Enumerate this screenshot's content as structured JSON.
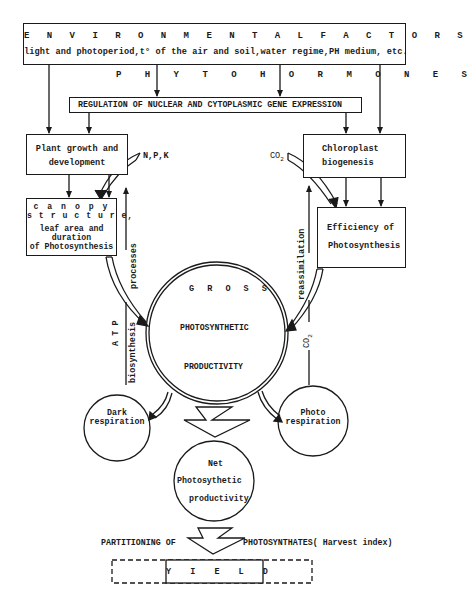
{
  "environmental_factors": {
    "title": "E N V I R O N M E N T A L   F A C T O R S",
    "subtitle": "light and photoperiod,t° of the air and soil,water regime,PH medium, etc."
  },
  "phytohormones": {
    "label": "P H Y T O H O R M O N E S"
  },
  "regulation": {
    "label": "REGULATION OF NUCLEAR AND CYTOPLASMIC GENE EXPRESSION"
  },
  "plant_growth": {
    "line1": "Plant growth  and",
    "line2": "development"
  },
  "npk": {
    "label": "N,P,K"
  },
  "chloroplast": {
    "line1": "Chloroplast",
    "line2": "biogenesis"
  },
  "co2_top": {
    "label": "CO",
    "sub": "2"
  },
  "canopy": {
    "line1": "c a n o p y",
    "line2": "s t r u c t u r e,",
    "line3": "leaf area  and",
    "line4": "duration",
    "line5": "of Photosynthesis"
  },
  "efficiency": {
    "line1": "Efficiency of",
    "line2": "Photosynthesis"
  },
  "left_vertical": {
    "processes": "processes",
    "biosynthesis": "biosynthesis",
    "atp": "A T P"
  },
  "right_vertical": {
    "reassimilation": "reassimilation",
    "co2": "CO",
    "co2_sub": "2"
  },
  "gross": {
    "line1": "G R O S S",
    "line2": "PHOTOSYNTHETIC",
    "line3": "PRODUCTIVITY"
  },
  "dark_respiration": {
    "line1": "Dark",
    "line2": "respiration"
  },
  "photo_respiration": {
    "line1": "Photo",
    "line2": "respiration"
  },
  "net": {
    "line1": "Net",
    "line2": "Photosythetic",
    "line3": "productivity"
  },
  "partitioning": {
    "left": "PARTITIONING  OF",
    "right": "PHOTOSYNTHATES( Harvest index)"
  },
  "yield": {
    "label": "Y I E L D"
  },
  "colors": {
    "ink": "#1a1a1a",
    "paper": "#ffffff"
  }
}
